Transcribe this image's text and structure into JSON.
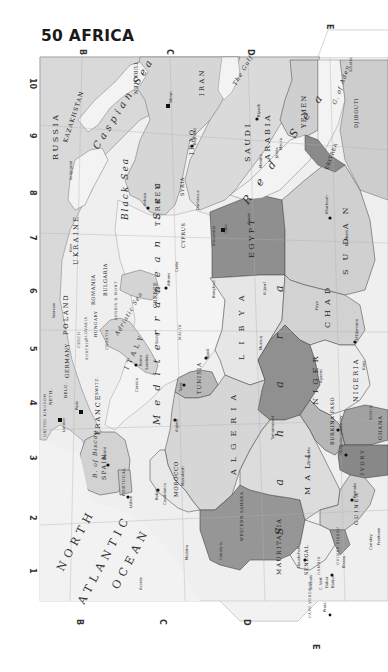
{
  "page": {
    "title": "50 AFRICA"
  },
  "grid": {
    "letters_top": [
      "B",
      "C",
      "D",
      "E"
    ],
    "letters_bottom": [
      "B",
      "C",
      "D",
      "E"
    ],
    "numbers_left": [
      "10",
      "9",
      "8",
      "7",
      "6",
      "5",
      "4",
      "3",
      "2",
      "1"
    ]
  },
  "colors": {
    "paper": "#ffffff",
    "sea": "#f0f0f0",
    "land_light": "#e2e2e2",
    "land_mid": "#d0d0d0",
    "land_dark": "#9a9a9a",
    "land_darker": "#8a8a8a",
    "border": "#555555"
  },
  "labels": {
    "oceans": [
      "NORTH",
      "ATLANTIC",
      "OCEAN"
    ],
    "seas": {
      "caspian": "Caspian Sea",
      "black": "Black Sea",
      "mediterranean": "Mediterranean Sea",
      "red": "Red Sea",
      "gulf": "The Gulf",
      "adriatic": "Adriatic Sea",
      "biscay": "B. of Biscay",
      "aden": "G. of Aden"
    },
    "desert": "Sahara",
    "countries": {
      "russia": "RUSSIA",
      "kazakhstan": "KAZAKHSTAN",
      "ukraine": "UKRAINE",
      "turkmen": "TURKMEN.",
      "iran": "IRAN",
      "iraq": "IRAQ",
      "syria": "SYRIA",
      "turkey": "TURKEY",
      "cyprus": "CYPRUS",
      "saudi_arabia_1": "SAUDI",
      "saudi_arabia_2": "ARABIA",
      "yemen": "YEMEN",
      "egypt": "EGYPT",
      "sudan": "SUDAN",
      "eritrea": "ERITREA",
      "djibouti": "DJIBOUTI",
      "libya": "LIBYA",
      "chad": "CHAD",
      "niger": "NIGER",
      "nigeria": "NIGERIA",
      "tunisia": "TUNISIA",
      "algeria": "ALGERIA",
      "morocco": "MOROCCO",
      "mauritania": "MAURITANIA",
      "mali": "MALI",
      "burkina": "BURKINA FASO",
      "senegal": "SENEGAL",
      "gambia": "GAMBIA",
      "guinea": "GUINEA",
      "guinea_bissau": "GUINEA BISSAU",
      "ivory": "IVORY",
      "ghana": "GHANA",
      "benin": "BENIN",
      "poland": "POLAND",
      "germany": "GERMANY",
      "france": "FRANCE",
      "spain": "SPAIN",
      "portugal": "PORTUGAL",
      "italy": "ITALY",
      "greece": "GREECE",
      "romania": "ROMANIA",
      "bulgaria": "BULGARIA",
      "hungary": "HUNGARY",
      "croatia": "CROATIA",
      "switz": "SWITZ.",
      "belg": "BELG.",
      "neth": "NETH.",
      "uk": "UNITED KINGDOM",
      "austria": "AUSTRIA",
      "czech": "CZECH",
      "slovakia": "SLOVAKIA",
      "serbia": "SERBIA & MONT.",
      "malta": "MALTA",
      "western_sahara": "WESTERN SAHARA",
      "cape_verde": "CAPE VERDE IS."
    },
    "places": {
      "london": "London",
      "paris": "Paris",
      "madrid": "Madrid",
      "lisbon": "Lisbon",
      "rome": "Rome",
      "athens": "Athens",
      "ankara": "Ankara",
      "tehran": "Tehran",
      "baghdad": "Baghdad",
      "riyadh": "Riyadh",
      "cairo": "Cairo",
      "tripoli": "Tripoli",
      "tunis": "Tunis",
      "algiers": "Algiers",
      "rabat": "Rabat",
      "casablanca": "Casablanca",
      "marrakesh": "Marrakesh",
      "dakar": "Dakar",
      "bamako": "Bamako",
      "niamey": "Niamey",
      "ouagadougou": "Ouagadougou",
      "ndjamena": "N'Djamena",
      "khartoum": "Khartoum",
      "nouakchott": "Nouakchott",
      "mecca": "Mecca",
      "jedda": "Jedda",
      "medina": "Medina",
      "benghazi": "Benghazi",
      "aswan": "Aswan",
      "alexandria": "Alexandria",
      "damascus": "Damascus",
      "beirut": "Beirut",
      "kiev": "Kiev",
      "warsaw": "Warsaw",
      "berlin": "Berlin",
      "volgograd": "Volgograd",
      "sicily": "Sicily",
      "sardinia": "Sardinia",
      "corsica": "Corsica",
      "crete": "Crete",
      "madeira": "Madeira",
      "canary": "Canary Is.",
      "azores": "Azores",
      "praia": "Praia",
      "socotra": "Socotra",
      "el_obeid": "El Obeid",
      "kano": "Kano",
      "agadez": "Agadez",
      "timbuktu": "Timbuktu",
      "tamanrasset": "Tamanrasset",
      "conakry": "Conakry",
      "freetown": "Freetown",
      "bissau": "Bissau",
      "banjul": "Banjul",
      "st_louis": "St-Louis",
      "c_vert": "C. Vert",
      "kufra": "Al Jawf",
      "murzuq": "Murzuq",
      "faya": "Faya"
    }
  }
}
